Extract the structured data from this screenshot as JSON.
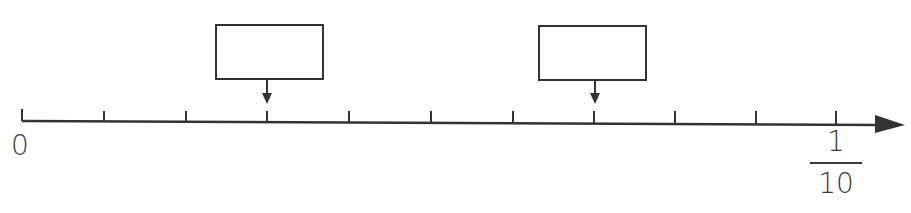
{
  "number_line": {
    "start_label": "0",
    "end_label": {
      "numerator": "1",
      "denominator": "10"
    },
    "tick_count": 11,
    "intervals": 10,
    "axis_color": "#333333"
  },
  "answer_boxes": [
    {
      "name": "answer-box-left",
      "points_to_tick": 3,
      "value": ""
    },
    {
      "name": "answer-box-right",
      "points_to_tick": 7,
      "value": ""
    }
  ]
}
